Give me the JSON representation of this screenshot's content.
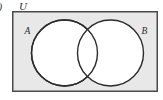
{
  "figure": {
    "type": "venn-diagram",
    "item_marker": ")",
    "universal_set_label": "U",
    "sets": [
      {
        "id": "A",
        "label": "A",
        "side": "left"
      },
      {
        "id": "B",
        "label": "B",
        "side": "right"
      }
    ],
    "colors": {
      "page_background": "#ffffff",
      "rectangle_fill": "#e8e8e8",
      "rectangle_stroke": "#4a4a4a",
      "circle_fill": "#ffffff",
      "circle_stroke": "#2b2b2b",
      "label_color": "#2b2b2b"
    },
    "geometry": {
      "rectangle": {
        "x": 12,
        "y": 11,
        "width": 146,
        "height": 81
      },
      "circle_a": {
        "cx": 64.5,
        "cy": 53,
        "r": 33.5
      },
      "circle_b": {
        "cx": 110.5,
        "cy": 53,
        "r": 33.5
      }
    }
  }
}
